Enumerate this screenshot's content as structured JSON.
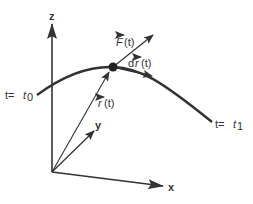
{
  "diagram": {
    "axes": {
      "z_label": "z",
      "y_label": "y",
      "x_label": "x"
    },
    "curve": {
      "start_label_prefix": "t=",
      "start_label_var": "t",
      "start_label_sub": "0",
      "end_label_prefix": "t=",
      "end_label_var": "t",
      "end_label_sub": "1"
    },
    "vectors": {
      "position": {
        "symbol": "r",
        "arg": "(t)"
      },
      "force": {
        "symbol": "F",
        "arg": "(t)"
      },
      "displacement": {
        "prefix": "d",
        "symbol": "r",
        "arg": "(t)"
      }
    },
    "colors": {
      "stroke": "#333333",
      "point": "#222222",
      "background": "#ffffff"
    }
  }
}
